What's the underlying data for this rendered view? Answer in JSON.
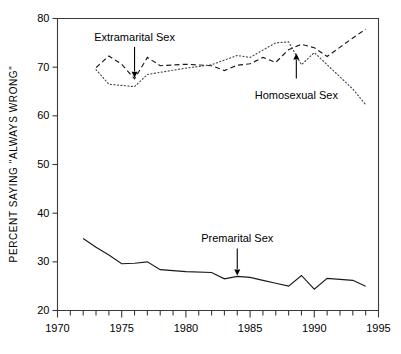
{
  "chart_data": {
    "type": "line",
    "title": "",
    "xlabel": "",
    "ylabel": "PERCENT SAYING \"ALWAYS WRONG\"",
    "xlim": [
      1970,
      1995
    ],
    "ylim": [
      20,
      80
    ],
    "ytick_labels": [
      "20",
      "30",
      "40",
      "50",
      "60",
      "70",
      "80"
    ],
    "ytick_values": [
      20,
      30,
      40,
      50,
      60,
      70,
      80
    ],
    "xtick_labels": [
      "1970",
      "1975",
      "1980",
      "1985",
      "1990",
      "1995"
    ],
    "xtick_values": [
      1970,
      1975,
      1980,
      1985,
      1990,
      1995
    ],
    "minor_xticks_every": 1,
    "grid": false,
    "legend": "none (inline arrow annotations)",
    "series": [
      {
        "name": "Premarital Sex",
        "style": "solid",
        "x": [
          1972,
          1973,
          1974,
          1975,
          1976,
          1977,
          1978,
          1980,
          1982,
          1983,
          1984,
          1985,
          1986,
          1987,
          1988,
          1989,
          1990,
          1991,
          1993,
          1994
        ],
        "values": [
          34.8,
          33.0,
          31.4,
          29.6,
          29.7,
          30.0,
          28.4,
          28.0,
          27.8,
          26.5,
          27.0,
          26.8,
          26.2,
          25.6,
          25.0,
          27.2,
          24.4,
          26.6,
          26.2,
          25.0
        ]
      },
      {
        "name": "Extramarital Sex",
        "style": "dashed",
        "x": [
          1973,
          1974,
          1975,
          1976,
          1977,
          1978,
          1980,
          1982,
          1983,
          1984,
          1985,
          1986,
          1987,
          1988,
          1989,
          1990,
          1991,
          1993,
          1994
        ],
        "values": [
          69.9,
          72.3,
          70.6,
          67.6,
          72.0,
          70.3,
          70.6,
          70.3,
          69.3,
          70.4,
          70.7,
          72.0,
          71.0,
          73.6,
          74.7,
          74.0,
          72.2,
          76.0,
          77.8
        ]
      },
      {
        "name": "Homosexual Sex",
        "style": "dotted",
        "x": [
          1973,
          1974,
          1976,
          1977,
          1980,
          1982,
          1984,
          1985,
          1987,
          1988,
          1989,
          1990,
          1991,
          1993,
          1994
        ],
        "values": [
          69.5,
          66.5,
          66.0,
          68.5,
          69.8,
          70.5,
          72.4,
          72.0,
          75.0,
          75.2,
          70.5,
          73.0,
          70.5,
          65.5,
          62.3
        ]
      }
    ],
    "annotations": [
      {
        "label": "Extramarital Sex",
        "target_year": 1976,
        "target_value": 67.6
      },
      {
        "label": "Homosexual Sex",
        "target_year": 1988.6,
        "target_value": 73.0
      },
      {
        "label": "Premarital Sex",
        "target_year": 1984,
        "target_value": 27.0
      }
    ]
  }
}
